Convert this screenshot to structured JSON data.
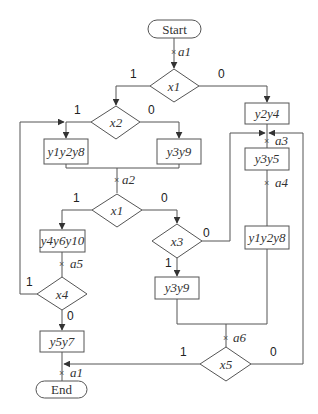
{
  "diagram": {
    "type": "flowchart",
    "terminals": {
      "start": "Start",
      "end": "End"
    },
    "decisions": {
      "x1_top": "x1",
      "x2": "x2",
      "x1_mid": "x1",
      "x3": "x3",
      "x4": "x4",
      "x5": "x5"
    },
    "operations": {
      "y2y4": "y2y4",
      "y1y2y8_left": "y1y2y8",
      "y3y9_top": "y3y9",
      "y3y5": "y3y5",
      "y1y2y8_right": "y1y2y8",
      "y4y6y10": "y4y6y10",
      "y3y9_bottom": "y3y9",
      "y5y7": "y5y7"
    },
    "markers": {
      "a1_top": "a1",
      "a2": "a2",
      "a3": "a3",
      "a4": "a4",
      "a5": "a5",
      "a6": "a6",
      "a1_bottom": "a1"
    },
    "edge_labels": {
      "x1_top_true": "1",
      "x1_top_false": "0",
      "x2_true": "1",
      "x2_false": "0",
      "x1_mid_true": "1",
      "x1_mid_false": "0",
      "x3_false": "0",
      "x3_true": "1",
      "x4_true": "1",
      "x4_false": "0",
      "x5_true": "1",
      "x5_false": "0"
    }
  }
}
